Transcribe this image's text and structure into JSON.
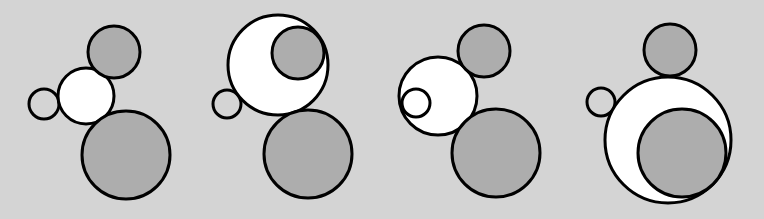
{
  "colors": {
    "background": "#d4d4d4",
    "gray_fill": "#adadad",
    "white_fill": "#ffffff",
    "stroke": "#000000"
  },
  "panels": [
    {
      "id": "panel-1",
      "circles": [
        {
          "name": "small-circle",
          "cx": 44,
          "cy": 104,
          "r": 15,
          "fill": "none"
        },
        {
          "name": "white-circle",
          "cx": 86,
          "cy": 96,
          "r": 28,
          "fill": "white"
        },
        {
          "name": "top-gray-circle",
          "cx": 114,
          "cy": 52,
          "r": 26,
          "fill": "gray"
        },
        {
          "name": "large-gray-circle",
          "cx": 126,
          "cy": 155,
          "r": 44,
          "fill": "gray"
        }
      ]
    },
    {
      "id": "panel-2",
      "circles": [
        {
          "name": "small-circle",
          "cx": 227,
          "cy": 104,
          "r": 14,
          "fill": "none"
        },
        {
          "name": "white-circle",
          "cx": 278,
          "cy": 65,
          "r": 50,
          "fill": "white"
        },
        {
          "name": "top-gray-circle",
          "cx": 298,
          "cy": 53,
          "r": 26,
          "fill": "gray"
        },
        {
          "name": "large-gray-circle",
          "cx": 308,
          "cy": 154,
          "r": 44,
          "fill": "gray"
        }
      ]
    },
    {
      "id": "panel-3",
      "circles": [
        {
          "name": "white-circle",
          "cx": 438,
          "cy": 96,
          "r": 39,
          "fill": "white"
        },
        {
          "name": "small-circle",
          "cx": 416,
          "cy": 103,
          "r": 14,
          "fill": "none"
        },
        {
          "name": "top-gray-circle",
          "cx": 484,
          "cy": 51,
          "r": 26,
          "fill": "gray"
        },
        {
          "name": "large-gray-circle",
          "cx": 496,
          "cy": 153,
          "r": 44,
          "fill": "gray"
        }
      ]
    },
    {
      "id": "panel-4",
      "circles": [
        {
          "name": "small-circle",
          "cx": 601,
          "cy": 102,
          "r": 14,
          "fill": "none"
        },
        {
          "name": "top-gray-circle",
          "cx": 670,
          "cy": 50,
          "r": 26,
          "fill": "gray"
        },
        {
          "name": "white-circle",
          "cx": 668,
          "cy": 140,
          "r": 63,
          "fill": "white"
        },
        {
          "name": "large-gray-circle",
          "cx": 682,
          "cy": 153,
          "r": 44,
          "fill": "gray"
        }
      ]
    }
  ]
}
